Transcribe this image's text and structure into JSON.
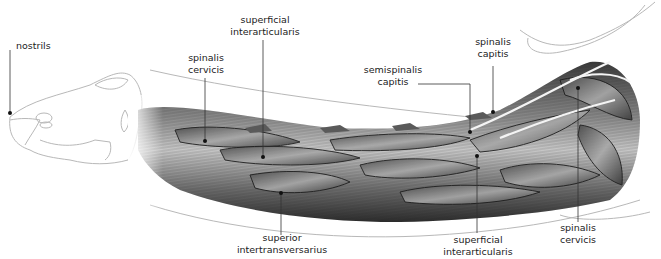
{
  "diagram": {
    "colors": {
      "outline": "#b8b8b8",
      "muscle_dark": "#2e2e2e",
      "muscle_mid": "#6e6e6e",
      "muscle_light": "#bdbdbd",
      "leader_line": "#333333",
      "text": "#222222"
    },
    "labels": [
      {
        "id": "nostrils",
        "lines": [
          "nostrils"
        ]
      },
      {
        "id": "spinalis-cervicis-top",
        "lines": [
          "spinalis",
          "cervicis"
        ]
      },
      {
        "id": "superficial-interarticularis-top",
        "lines": [
          "superficial",
          "interarticularis"
        ]
      },
      {
        "id": "semispinalis-capitis",
        "lines": [
          "semispinalis",
          "capitis"
        ]
      },
      {
        "id": "spinalis-capitis",
        "lines": [
          "spinalis",
          "capitis"
        ]
      },
      {
        "id": "superior-intertransversarius",
        "lines": [
          "superior",
          "intertransversarius"
        ]
      },
      {
        "id": "superficial-interarticularis-bottom",
        "lines": [
          "superficial",
          "interarticularis"
        ]
      },
      {
        "id": "spinalis-cervicis-bottom",
        "lines": [
          "spinalis",
          "cervicis"
        ]
      }
    ]
  }
}
